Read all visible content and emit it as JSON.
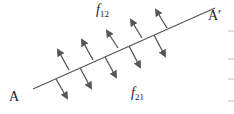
{
  "diagram": {
    "title": "",
    "line": {
      "start_label": "A",
      "end_label": "A′",
      "x1": 33,
      "y1": 89,
      "x2": 215,
      "y2": 8
    },
    "labels": {
      "top_force": {
        "symbol": "f",
        "subscript": "12"
      },
      "bottom_force": {
        "symbol": "f",
        "subscript": "21"
      }
    },
    "arrows_up": [
      {
        "x1": 69,
        "y1": 70,
        "x2": 58,
        "y2": 50
      },
      {
        "x1": 93,
        "y1": 60,
        "x2": 82,
        "y2": 40
      },
      {
        "x1": 118,
        "y1": 48,
        "x2": 107,
        "y2": 31
      },
      {
        "x1": 142,
        "y1": 38,
        "x2": 131,
        "y2": 20
      },
      {
        "x1": 167,
        "y1": 28,
        "x2": 156,
        "y2": 10
      }
    ],
    "arrows_down": [
      {
        "x1": 56,
        "y1": 79,
        "x2": 67,
        "y2": 98
      },
      {
        "x1": 80,
        "y1": 68,
        "x2": 91,
        "y2": 88
      },
      {
        "x1": 105,
        "y1": 57,
        "x2": 116,
        "y2": 77
      },
      {
        "x1": 129,
        "y1": 46,
        "x2": 140,
        "y2": 67
      },
      {
        "x1": 154,
        "y1": 35,
        "x2": 165,
        "y2": 56
      }
    ],
    "colors": {
      "line": "#555555",
      "arrow": "#555555"
    }
  }
}
